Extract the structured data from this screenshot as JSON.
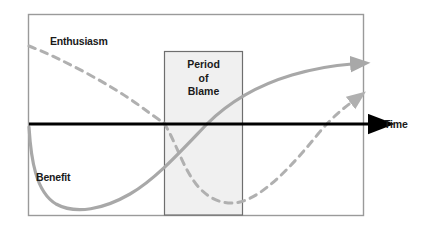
{
  "figure": {
    "type": "diagram",
    "frame": {
      "x": 28,
      "y": 14,
      "width": 336,
      "height": 202,
      "border_color": "#9a9a9a"
    },
    "background_color": "#ffffff"
  },
  "axis": {
    "label": "Time",
    "color": "#000000",
    "orientation": "horizontal",
    "y": 124,
    "x_start": 29,
    "x_end": 378,
    "arrowhead": "solid-triangle",
    "arrow_icon_name": "axis-arrow-icon"
  },
  "shaded_region": {
    "title_lines": [
      "Period",
      "of",
      "Blame"
    ],
    "fill_color": "#f0f0f0",
    "border_color": "#6e6e6e",
    "x": 164,
    "y": 51,
    "width": 79,
    "height": 164
  },
  "curves": [
    {
      "name": "Enthusiasm",
      "label": "Enthusiasm",
      "style": "dashed",
      "color": "#b0b0b0",
      "dash_pattern": "7 6",
      "stroke_width": 3,
      "arrowhead": true,
      "shape_note": "starts high at left, falls steadily crossing axis at left edge of blame band, troughs below axis inside band, then rises to arrow at right",
      "points": [
        {
          "x": 29,
          "y": 46
        },
        {
          "x": 80,
          "y": 70
        },
        {
          "x": 130,
          "y": 98
        },
        {
          "x": 164,
          "y": 122
        },
        {
          "x": 190,
          "y": 160
        },
        {
          "x": 212,
          "y": 192
        },
        {
          "x": 236,
          "y": 203
        },
        {
          "x": 262,
          "y": 190
        },
        {
          "x": 292,
          "y": 158
        },
        {
          "x": 322,
          "y": 126
        },
        {
          "x": 352,
          "y": 102
        }
      ]
    },
    {
      "name": "Benefit",
      "label": "Benefit",
      "style": "solid",
      "color": "#a8a8a8",
      "stroke_width": 3.2,
      "arrowhead": true,
      "shape_note": "starts at axis level on left, plunges to a trough near bottom left, then rises through the blame band crossing the axis and flattens out high at right",
      "points": [
        {
          "x": 29,
          "y": 127
        },
        {
          "x": 38,
          "y": 170
        },
        {
          "x": 52,
          "y": 200
        },
        {
          "x": 76,
          "y": 210
        },
        {
          "x": 104,
          "y": 206
        },
        {
          "x": 140,
          "y": 186
        },
        {
          "x": 176,
          "y": 152
        },
        {
          "x": 207,
          "y": 124
        },
        {
          "x": 246,
          "y": 96
        },
        {
          "x": 288,
          "y": 77
        },
        {
          "x": 326,
          "y": 68
        },
        {
          "x": 352,
          "y": 64
        }
      ]
    }
  ],
  "labels": {
    "enthusiasm": "Enthusiasm",
    "benefit": "Benefit",
    "time": "Time",
    "period_line1": "Period",
    "period_line2": "of",
    "period_line3": "Blame"
  }
}
